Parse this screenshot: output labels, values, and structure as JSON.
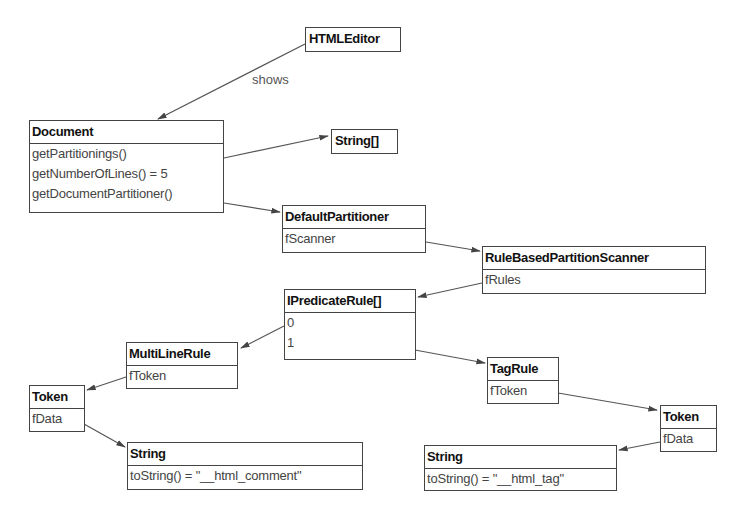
{
  "diagram": {
    "edge_label": "shows",
    "nodes": {
      "html_editor": {
        "title": "HTMLEditor"
      },
      "document": {
        "title": "Document",
        "rows": [
          "getPartitionings()",
          "getNumberOfLines() = 5",
          "getDocumentPartitioner()"
        ]
      },
      "string_array": {
        "title": "String[]"
      },
      "default_partitioner": {
        "title": "DefaultPartitioner",
        "rows": [
          "fScanner"
        ]
      },
      "rule_based_scanner": {
        "title": "RuleBasedPartitionScanner",
        "rows": [
          "fRules"
        ]
      },
      "predicate_rules": {
        "title": "IPredicateRule[]",
        "rows": [
          "0",
          "1"
        ]
      },
      "multiline_rule": {
        "title": "MultiLineRule",
        "rows": [
          "fToken"
        ]
      },
      "token_left": {
        "title": "Token",
        "rows": [
          "fData"
        ]
      },
      "string_left": {
        "title": "String",
        "rows": [
          "toString() = \"__html_comment\""
        ]
      },
      "tag_rule": {
        "title": "TagRule",
        "rows": [
          "fToken"
        ]
      },
      "token_right": {
        "title": "Token",
        "rows": [
          "fData"
        ]
      },
      "string_right": {
        "title": "String",
        "rows": [
          "toString() = \"__html_tag\""
        ]
      }
    },
    "edges": [
      {
        "from": "HTMLEditor",
        "to": "Document",
        "label": "shows"
      },
      {
        "from": "Document.getPartitionings()",
        "to": "String[]"
      },
      {
        "from": "Document.getDocumentPartitioner()",
        "to": "DefaultPartitioner"
      },
      {
        "from": "DefaultPartitioner.fScanner",
        "to": "RuleBasedPartitionScanner"
      },
      {
        "from": "RuleBasedPartitionScanner.fRules",
        "to": "IPredicateRule[]"
      },
      {
        "from": "IPredicateRule[].0",
        "to": "MultiLineRule"
      },
      {
        "from": "IPredicateRule[].1",
        "to": "TagRule"
      },
      {
        "from": "MultiLineRule.fToken",
        "to": "Token"
      },
      {
        "from": "Token.fData",
        "to": "String (__html_comment)"
      },
      {
        "from": "TagRule.fToken",
        "to": "Token"
      },
      {
        "from": "Token.fData",
        "to": "String (__html_tag)"
      }
    ],
    "colors": {
      "border": "#444444",
      "line": "#444444",
      "background": "#ffffff"
    }
  }
}
